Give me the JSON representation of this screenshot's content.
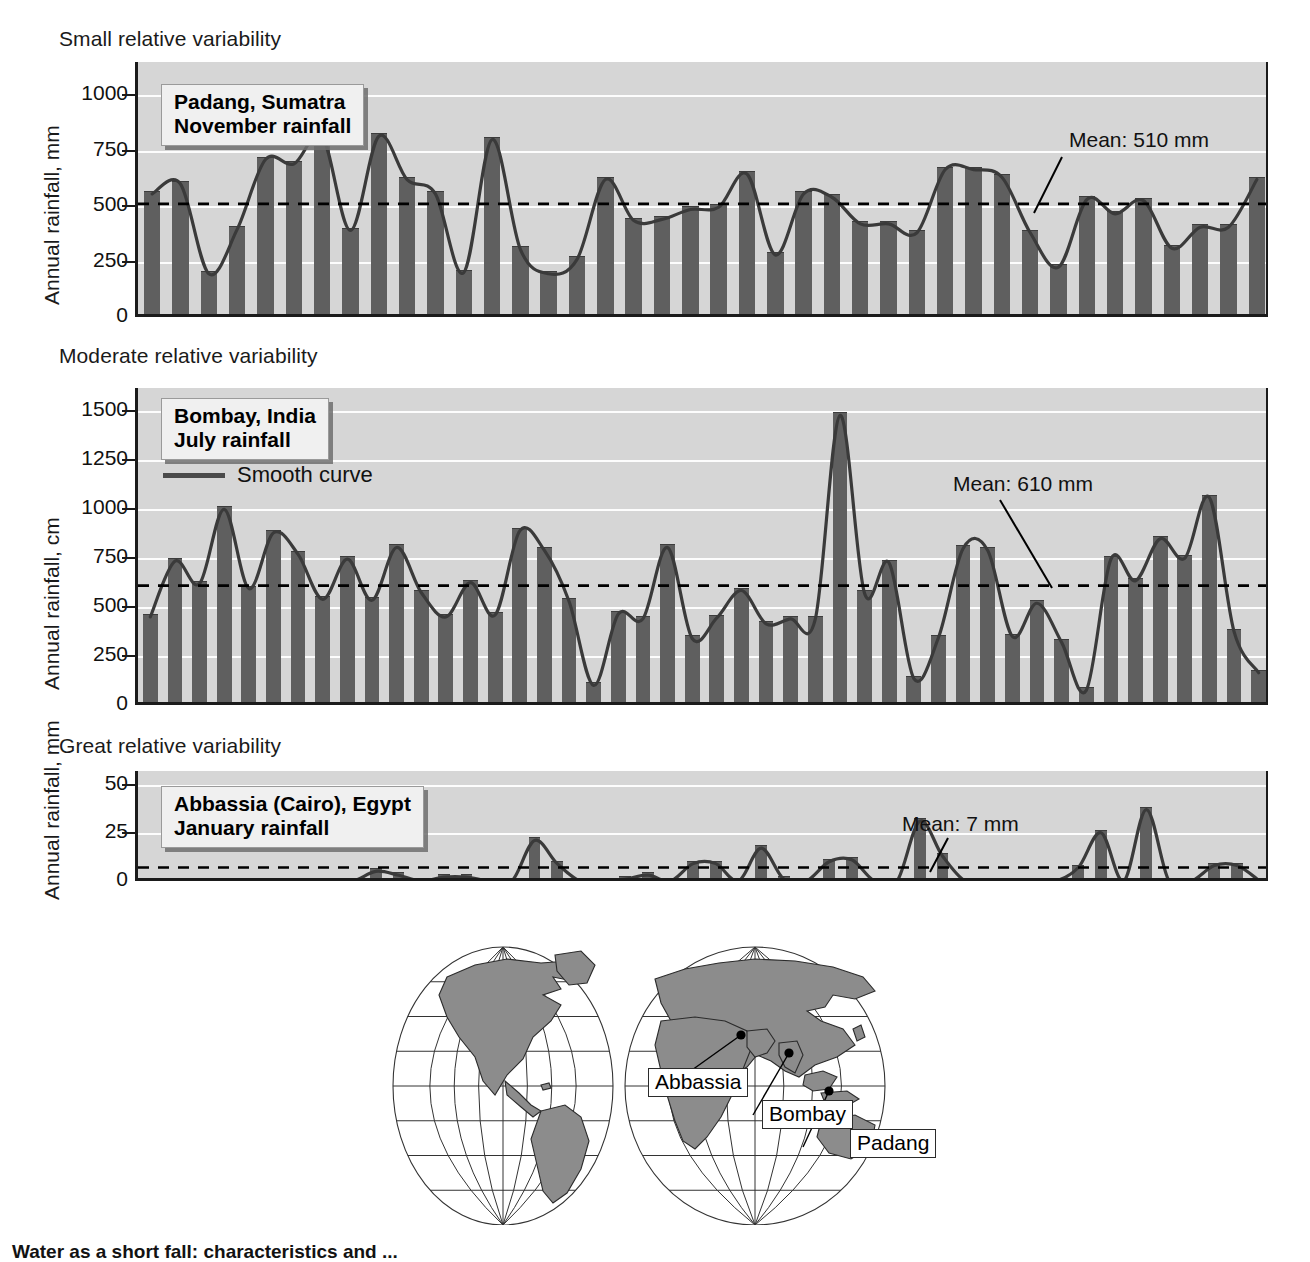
{
  "figure": {
    "caption": "Water as a short fall: characteristics and ... ",
    "ylabel_mm": "Annual rainfall, mm",
    "ylabel_cm": "Annual rainfall, cm"
  },
  "panels": [
    {
      "heading": "Small relative variability",
      "title_line1": "Padang, Sumatra",
      "title_line2": "November rainfall",
      "mean_label": "Mean: 510 mm",
      "ylabel": "Annual rainfall, mm"
    },
    {
      "heading": "Moderate relative variability",
      "title_line1": "Bombay, India",
      "title_line2": "July rainfall",
      "legend_label": "Smooth curve",
      "mean_label": "Mean: 610 mm",
      "ylabel": "Annual rainfall, cm"
    },
    {
      "heading": "Great relative variability",
      "title_line1": "Abbassia (Cairo), Egypt",
      "title_line2": "January rainfall",
      "mean_label": "Mean: 7 mm",
      "ylabel": "Annual rainfall, mm"
    }
  ],
  "map": {
    "labels": [
      {
        "name": "Abbassia"
      },
      {
        "name": "Bombay"
      },
      {
        "name": "Padang"
      }
    ]
  },
  "colors": {
    "bar": "#5f5f5f",
    "plot_background": "#d6d6d6",
    "gridline": "#fdfdfd",
    "axis": "#1b1b1b",
    "curve": "#3a3a3a",
    "mean_line": "#000000",
    "land": "#8c8c8c"
  },
  "chart_data": [
    {
      "type": "bar",
      "title": "Padang, Sumatra — November rainfall",
      "xlabel": "",
      "ylabel": "Annual rainfall, mm",
      "ylim": [
        0,
        1150
      ],
      "yticks": [
        0,
        250,
        500,
        750,
        1000
      ],
      "ytick_labels": [
        "0",
        "250",
        "500",
        "750",
        "1000"
      ],
      "grid": true,
      "mean": 510,
      "mean_label": "Mean: 510 mm",
      "smooth_curve": true,
      "values": [
        555,
        600,
        195,
        395,
        710,
        690,
        815,
        390,
        815,
        620,
        555,
        200,
        800,
        305,
        195,
        260,
        620,
        435,
        440,
        485,
        495,
        645,
        280,
        555,
        540,
        420,
        420,
        380,
        665,
        665,
        630,
        380,
        225,
        530,
        465,
        525,
        310,
        405,
        405,
        620
      ]
    },
    {
      "type": "bar",
      "title": "Bombay, India — July rainfall",
      "xlabel": "",
      "ylabel": "Annual rainfall, cm",
      "ylim": [
        0,
        1620
      ],
      "yticks": [
        0,
        250,
        500,
        750,
        1000,
        1250,
        1500
      ],
      "ytick_labels": [
        "0",
        "250",
        "500",
        "750",
        "1000",
        "1250",
        "1500"
      ],
      "grid": true,
      "mean": 610,
      "mean_label": "Mean: 610 mm",
      "smooth_curve": true,
      "legend": [
        "Smooth curve"
      ],
      "values": [
        450,
        735,
        620,
        1000,
        595,
        880,
        770,
        540,
        745,
        535,
        805,
        575,
        450,
        625,
        460,
        890,
        790,
        530,
        100,
        465,
        440,
        805,
        340,
        445,
        585,
        415,
        440,
        440,
        1480,
        570,
        725,
        135,
        345,
        800,
        790,
        350,
        520,
        320,
        75,
        745,
        635,
        850,
        750,
        1060,
        375,
        165
      ]
    },
    {
      "type": "bar",
      "title": "Abbassia (Cairo), Egypt — January rainfall",
      "xlabel": "",
      "ylabel": "Annual rainfall, mm",
      "ylim": [
        0,
        57
      ],
      "yticks": [
        0,
        25,
        50
      ],
      "ytick_labels": [
        "0",
        "25",
        "50"
      ],
      "grid": true,
      "mean": 7,
      "mean_label": "Mean: 7 mm",
      "smooth_curve": true,
      "values": [
        0,
        0,
        0,
        0,
        0,
        0,
        0,
        0,
        0,
        0,
        5,
        3,
        0,
        2,
        2,
        0,
        0,
        21,
        9,
        0,
        0,
        1,
        3,
        0,
        9,
        9,
        0,
        17,
        1,
        0,
        10,
        11,
        0,
        0,
        31,
        13,
        0,
        0,
        0,
        0,
        0,
        7,
        25,
        0,
        37,
        0,
        0,
        8,
        8,
        0
      ]
    }
  ]
}
